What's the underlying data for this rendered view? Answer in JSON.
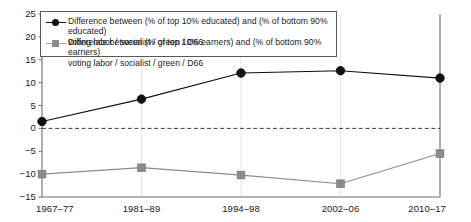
{
  "chart_data": {
    "type": "line",
    "title": "",
    "subtitle": "",
    "xlabel": "",
    "ylabel": "",
    "categories": [
      "1967–77",
      "1981–89",
      "1994–98",
      "2002–06",
      "2010–17"
    ],
    "ylim": [
      -15,
      25
    ],
    "yticks": [
      -15,
      -10,
      -5,
      0,
      5,
      10,
      15,
      20,
      25
    ],
    "ytick_labels": [
      "−15",
      "−10",
      "−5",
      "0",
      "5",
      "10",
      "15",
      "20",
      "25"
    ],
    "grid": "faint vertical gridlines at category positions; dashed horizontal reference line at y=0",
    "legend_position": "upper left inside axes",
    "series": [
      {
        "name": "Difference between (% of top 10% educated) and (% of bottom 90% educated) voting labor / socialist / green / D66",
        "legend_line1": "Difference between (% of top 10% educated) and (% of bottom 90% educated)",
        "legend_line2": "voting labor / socialist / green / D66",
        "marker": "circle",
        "color": "#111111",
        "values": [
          1.5,
          6.4,
          12.1,
          12.6,
          11.0
        ]
      },
      {
        "name": "Difference between (% of top 10% earners) and (% of bottom 90% earners) voting labor / socialist / green / D66",
        "legend_line1": "Difference between (% of top 10% earners) and (% of bottom 90% earners)",
        "legend_line2": "voting labor / socialist / green / D66",
        "marker": "square",
        "color": "#8c8c8c",
        "values": [
          -10.0,
          -8.6,
          -10.2,
          -12.1,
          -5.5
        ]
      }
    ]
  },
  "colors": {
    "axis": "#6b7074",
    "zero_line": "#3c3c3c",
    "gridline": "#e8e8e8",
    "series_1": "#111111",
    "series_2": "#8c8c8c",
    "legend_border": "#555a5e",
    "background": "#ffffff"
  }
}
